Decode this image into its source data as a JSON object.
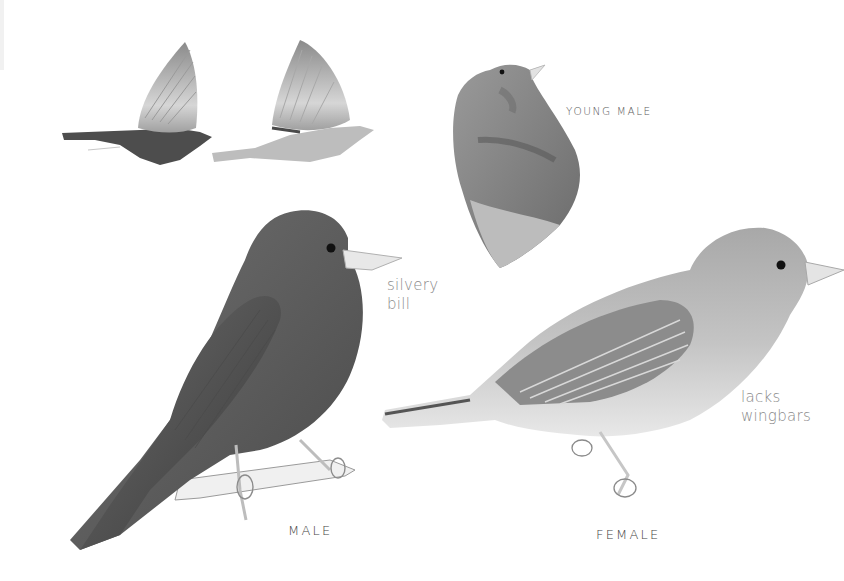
{
  "plate": {
    "subject": "bunting identification plate",
    "background_color": "#ffffff",
    "figures": [
      {
        "id": "flight-male",
        "kind": "flying bird, dark body"
      },
      {
        "id": "flight-female",
        "kind": "flying bird, pale body"
      },
      {
        "id": "young-male",
        "kind": "partial bird, head and upper body"
      },
      {
        "id": "male",
        "kind": "perched bird on twig"
      },
      {
        "id": "female",
        "kind": "perched bird"
      }
    ],
    "colors": {
      "male_body": "#5f5f5f",
      "male_dark": "#3c3c3c",
      "female_body": "#b4b4b4",
      "female_belly": "#e4e4e4",
      "bill": "#e8e8e8",
      "label_text": "#444444",
      "annotation_text": "#8a8a8a"
    }
  },
  "labels": {
    "young_male": "YOUNG MALE",
    "male": "MALE",
    "female": "FEMALE"
  },
  "annotations": {
    "silvery_bill": [
      "silvery",
      "bill"
    ],
    "lacks_wingbars": [
      "lacks",
      "wingbars"
    ]
  }
}
